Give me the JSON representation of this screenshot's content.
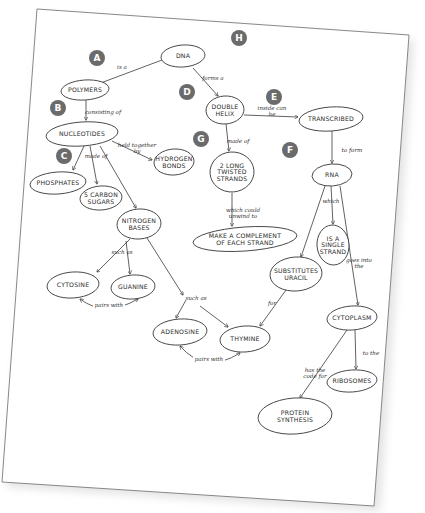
{
  "colors": {
    "paper": "#ffffff",
    "ink": "#3a3a3a",
    "badge": "#6b6b6b",
    "shadow": "#e4e4e4"
  },
  "badges": [
    {
      "id": "A",
      "x": 97,
      "y": 58
    },
    {
      "id": "B",
      "x": 58,
      "y": 108
    },
    {
      "id": "C",
      "x": 64,
      "y": 156
    },
    {
      "id": "D",
      "x": 187,
      "y": 92
    },
    {
      "id": "E",
      "x": 274,
      "y": 97
    },
    {
      "id": "G",
      "x": 201,
      "y": 139
    },
    {
      "id": "F",
      "x": 290,
      "y": 150
    },
    {
      "id": "H",
      "x": 239,
      "y": 38
    }
  ],
  "nodes": [
    {
      "id": "dna",
      "lines": [
        "DNA"
      ],
      "x": 183,
      "y": 56,
      "rx": 22,
      "ry": 11
    },
    {
      "id": "polymers",
      "lines": [
        "POLYMERS"
      ],
      "x": 85,
      "y": 90,
      "rx": 24,
      "ry": 10
    },
    {
      "id": "nucleotides",
      "lines": [
        "NUCLEOTIDES"
      ],
      "x": 82,
      "y": 134,
      "rx": 36,
      "ry": 12
    },
    {
      "id": "hydrogen_bonds",
      "lines": [
        "HYDROGEN",
        "BONDS"
      ],
      "x": 174,
      "y": 162,
      "rx": 20,
      "ry": 13
    },
    {
      "id": "phosphates",
      "lines": [
        "PHOSPHATES"
      ],
      "x": 58,
      "y": 183,
      "rx": 28,
      "ry": 11
    },
    {
      "id": "five_carbon_sugars",
      "lines": [
        "5 CARBON",
        "SUGARS"
      ],
      "x": 101,
      "y": 198,
      "rx": 21,
      "ry": 12
    },
    {
      "id": "nitrogen_bases",
      "lines": [
        "NITROGEN",
        "BASES"
      ],
      "x": 139,
      "y": 224,
      "rx": 22,
      "ry": 15
    },
    {
      "id": "double_helix",
      "lines": [
        "DOUBLE",
        "HELIX"
      ],
      "x": 225,
      "y": 110,
      "rx": 19,
      "ry": 14
    },
    {
      "id": "transcribed",
      "lines": [
        "TRANSCRIBED"
      ],
      "x": 331,
      "y": 119,
      "rx": 32,
      "ry": 12
    },
    {
      "id": "two_strands",
      "lines": [
        "2 LONG",
        "TWISTED",
        "STRANDS"
      ],
      "x": 232,
      "y": 172,
      "rx": 22,
      "ry": 20
    },
    {
      "id": "complement",
      "lines": [
        "MAKE A COMPLEMENT",
        "OF EACH STRAND"
      ],
      "x": 245,
      "y": 239,
      "rx": 52,
      "ry": 12
    },
    {
      "id": "rna",
      "lines": [
        "RNA"
      ],
      "x": 332,
      "y": 175,
      "rx": 20,
      "ry": 11
    },
    {
      "id": "single_strand",
      "lines": [
        "IS A",
        "SINGLE",
        "STRAND"
      ],
      "x": 333,
      "y": 245,
      "rx": 16,
      "ry": 20
    },
    {
      "id": "substitutes_uracil",
      "lines": [
        "SUBSTITUTES",
        "URACIL"
      ],
      "x": 296,
      "y": 274,
      "rx": 26,
      "ry": 17
    },
    {
      "id": "cytosine",
      "lines": [
        "CYTOSINE"
      ],
      "x": 73,
      "y": 285,
      "rx": 26,
      "ry": 13
    },
    {
      "id": "guanine",
      "lines": [
        "GUANINE"
      ],
      "x": 133,
      "y": 287,
      "rx": 22,
      "ry": 12
    },
    {
      "id": "adenosine",
      "lines": [
        "ADENOSINE"
      ],
      "x": 180,
      "y": 332,
      "rx": 27,
      "ry": 13
    },
    {
      "id": "thymine",
      "lines": [
        "THYMINE"
      ],
      "x": 245,
      "y": 339,
      "rx": 25,
      "ry": 13
    },
    {
      "id": "cytoplasm",
      "lines": [
        "CYTOPLASM"
      ],
      "x": 352,
      "y": 318,
      "rx": 25,
      "ry": 12
    },
    {
      "id": "ribosomes",
      "lines": [
        "RIBOSOMES"
      ],
      "x": 352,
      "y": 381,
      "rx": 25,
      "ry": 11
    },
    {
      "id": "protein_synthesis",
      "lines": [
        "PROTEIN",
        "SYNTHESIS"
      ],
      "x": 295,
      "y": 416,
      "rx": 37,
      "ry": 18
    }
  ],
  "edges": [
    {
      "from": [
        162,
        60
      ],
      "to": [
        98,
        84
      ],
      "label": "is a",
      "lx": 122,
      "ly": 69
    },
    {
      "from": [
        86,
        100
      ],
      "to": [
        86,
        120
      ],
      "label": "consisting of",
      "lx": 103,
      "ly": 114
    },
    {
      "from": [
        112,
        141
      ],
      "to": [
        152,
        160
      ],
      "label": "held together by",
      "lx": 137,
      "ly": 147
    },
    {
      "from": [
        84,
        146
      ],
      "to": [
        73,
        170
      ],
      "label": "made of",
      "lx": 96,
      "ly": 158
    },
    {
      "from": [
        90,
        146
      ],
      "to": [
        97,
        184
      ],
      "label": "",
      "lx": 0,
      "ly": 0
    },
    {
      "from": [
        100,
        146
      ],
      "to": [
        136,
        208
      ],
      "label": "",
      "lx": 0,
      "ly": 0
    },
    {
      "from": [
        193,
        68
      ],
      "to": [
        218,
        96
      ],
      "label": "forms a",
      "lx": 213,
      "ly": 80
    },
    {
      "from": [
        244,
        115
      ],
      "to": [
        298,
        117
      ],
      "label": "inside can be",
      "lx": 272,
      "ly": 110
    },
    {
      "from": [
        226,
        124
      ],
      "to": [
        229,
        151
      ],
      "label": "made of",
      "lx": 238,
      "ly": 143
    },
    {
      "from": [
        232,
        193
      ],
      "to": [
        232,
        226
      ],
      "label": "which could unwind to",
      "lx": 243,
      "ly": 212
    },
    {
      "from": [
        332,
        131
      ],
      "to": [
        332,
        163
      ],
      "label": "to form",
      "lx": 352,
      "ly": 152
    },
    {
      "from": [
        331,
        186
      ],
      "to": [
        333,
        224
      ],
      "label": "which",
      "lx": 331,
      "ly": 203
    },
    {
      "from": [
        325,
        186
      ],
      "to": [
        301,
        257
      ],
      "label": "",
      "lx": 0,
      "ly": 0
    },
    {
      "from": [
        340,
        186
      ],
      "to": [
        358,
        305
      ],
      "label": "goes into the",
      "lx": 359,
      "ly": 262
    },
    {
      "from": [
        130,
        239
      ],
      "to": [
        97,
        272
      ],
      "label": "such as",
      "lx": 122,
      "ly": 254
    },
    {
      "from": [
        126,
        241
      ],
      "to": [
        130,
        274
      ],
      "label": "",
      "lx": 0,
      "ly": 0
    },
    {
      "from": [
        147,
        238
      ],
      "to": [
        183,
        295
      ],
      "label": "",
      "lx": 0,
      "ly": 0
    },
    {
      "from": [
        186,
        300
      ],
      "to": [
        176,
        318
      ],
      "label": "such as",
      "lx": 196,
      "ly": 300
    },
    {
      "from": [
        200,
        306
      ],
      "to": [
        228,
        327
      ],
      "label": "",
      "lx": 0,
      "ly": 0
    },
    {
      "from": [
        286,
        290
      ],
      "to": [
        260,
        326
      ],
      "label": "for",
      "lx": 272,
      "ly": 305
    },
    {
      "from": [
        347,
        330
      ],
      "to": [
        300,
        398
      ],
      "label": "has the code for",
      "lx": 315,
      "ly": 372
    },
    {
      "from": [
        355,
        330
      ],
      "to": [
        356,
        369
      ],
      "label": "to the",
      "lx": 371,
      "ly": 355
    }
  ],
  "pair_links": [
    {
      "from": [
        80,
        299
      ],
      "to": [
        138,
        299
      ],
      "ctrl": [
        105,
        318
      ],
      "label": "pairs with",
      "lx": 109,
      "ly": 307
    },
    {
      "from": [
        180,
        346
      ],
      "to": [
        240,
        353
      ],
      "ctrl": [
        205,
        375
      ],
      "label": "pairs with",
      "lx": 209,
      "ly": 361
    }
  ]
}
